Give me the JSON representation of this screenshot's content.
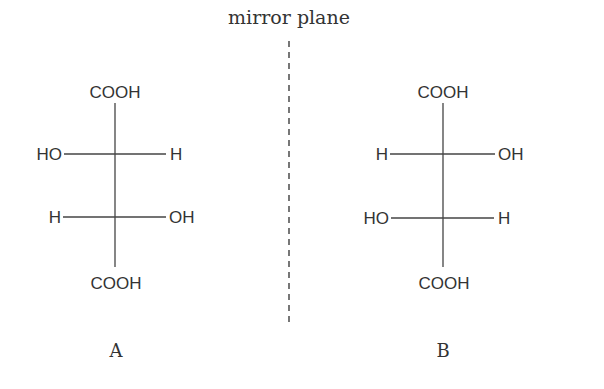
{
  "mirror_label": "mirror plane",
  "molecules": [
    {
      "label": "A",
      "top": "COOH",
      "bottom": "COOH",
      "upper_left": "HO",
      "upper_right": "H",
      "lower_left": "H",
      "lower_right": "OH"
    },
    {
      "label": "B",
      "top": "COOH",
      "bottom": "COOH",
      "upper_left": "H",
      "upper_right": "OH",
      "lower_left": "HO",
      "lower_right": "H"
    }
  ]
}
